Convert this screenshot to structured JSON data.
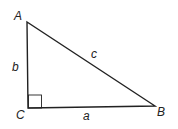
{
  "diagram": {
    "type": "right-triangle",
    "vertices": [
      {
        "name": "A",
        "label": "A"
      },
      {
        "name": "B",
        "label": "B"
      },
      {
        "name": "C",
        "label": "C"
      }
    ],
    "sides": [
      {
        "name": "a",
        "label": "a",
        "between": "C-B"
      },
      {
        "name": "b",
        "label": "b",
        "between": "A-C"
      },
      {
        "name": "c",
        "label": "c",
        "between": "A-B"
      }
    ],
    "right_angle_at": "C",
    "colors": {
      "stroke": "#222222",
      "background": "#ffffff"
    }
  }
}
